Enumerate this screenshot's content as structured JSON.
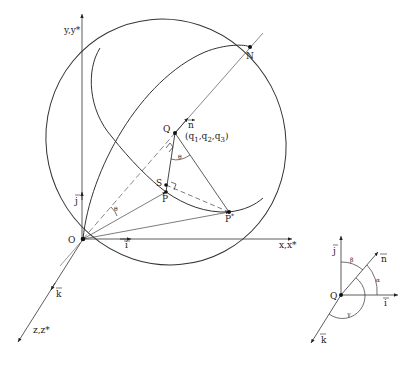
{
  "figure": {
    "main": {
      "axes": {
        "y": {
          "label": "y,y*"
        },
        "x": {
          "label": "x,x*"
        },
        "z": {
          "label": "z,z*"
        }
      },
      "unit_vectors": {
        "i": "i",
        "j": "j",
        "k": "k",
        "n": "n"
      },
      "points": {
        "O": "O",
        "N": "N",
        "Q": "Q",
        "S": "S",
        "P": "P",
        "P_star": "P",
        "star": "*"
      },
      "q_label": {
        "open": "(q",
        "s1": "1",
        "comma1": ",q",
        "s2": "2",
        "comma2": ",q",
        "s3": "3",
        "close": ")"
      },
      "angle_labels": {
        "at_O": "θ",
        "at_Q": "θ"
      }
    },
    "inset": {
      "point": "Q",
      "vectors": {
        "i": "i",
        "j": "j",
        "k": "k",
        "n": "n"
      },
      "angles": {
        "alpha": "α",
        "beta": "β",
        "gamma": "γ"
      }
    }
  }
}
